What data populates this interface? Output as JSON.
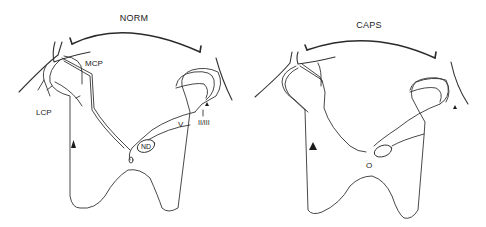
{
  "panels": [
    {
      "id": "norm",
      "title": "NORM",
      "labels": {
        "mcp": "MCP",
        "lcp": "LCP",
        "v": "V",
        "nd": "ND",
        "iiiii": "II/III",
        "canal": "O"
      }
    },
    {
      "id": "caps",
      "title": "CAPS",
      "labels": {
        "canal": "O"
      }
    }
  ],
  "colors": {
    "line": "#333333",
    "background": "#ffffff"
  }
}
